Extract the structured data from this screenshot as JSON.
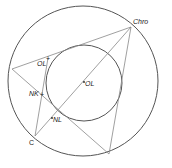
{
  "diagram": {
    "title": "",
    "outer_circle": {
      "cx": 83,
      "cy": 81,
      "r": 75,
      "stroke": "#555555"
    },
    "inner_circle": {
      "cx": 84,
      "cy": 83,
      "r": 38,
      "stroke": "#555555"
    },
    "points": {
      "chro": {
        "x": 131,
        "y": 27,
        "label": "Chro"
      },
      "left": {
        "x": 12,
        "y": 69
      },
      "c": {
        "x": 35,
        "y": 136,
        "label": "C"
      },
      "bottom": {
        "x": 109,
        "y": 154
      },
      "ol_tangent": {
        "x": 48,
        "y": 58,
        "label": "OL",
        "marker": "+"
      },
      "nk": {
        "x": 44,
        "y": 94,
        "label": "NK",
        "marker": "+"
      },
      "ol_center": {
        "x": 83,
        "y": 83,
        "label": "OL",
        "marker": "•"
      },
      "nl": {
        "x": 52,
        "y": 118,
        "label": "NL",
        "marker": "•"
      }
    },
    "segments": [
      [
        "chro",
        "left"
      ],
      [
        "chro",
        "c"
      ],
      [
        "chro",
        "bottom"
      ],
      [
        "left",
        "bottom"
      ],
      [
        "c",
        "ol_tangent"
      ]
    ],
    "line_color": "#888888"
  }
}
